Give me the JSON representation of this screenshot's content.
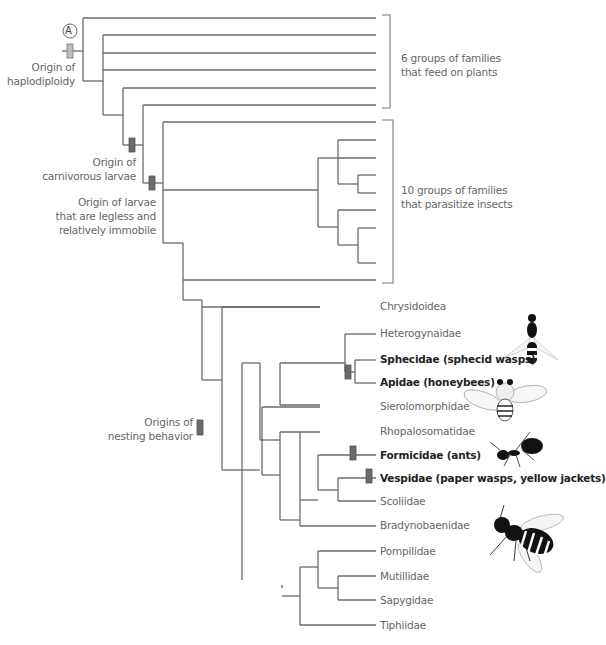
{
  "colors": {
    "line": "#6a6a6a",
    "marker_light": "#bdbdbd",
    "marker_dark": "#6b6b6b",
    "text": "#666666",
    "text_bold": "#222222"
  },
  "callout": {
    "letter": "A"
  },
  "annotations": {
    "haplodiploidy": [
      "Origin of",
      "haplodiploidy"
    ],
    "carnivorous": [
      "Origin of",
      "carnivorous larvae"
    ],
    "legless": [
      "Origin of larvae",
      "that are legless and",
      "relatively immobile"
    ],
    "nesting": [
      "Origins of",
      "nesting behavior"
    ]
  },
  "groups": {
    "plants": [
      "6 groups of families",
      "that feed on plants"
    ],
    "parasites": [
      "10 groups of families",
      "that parasitize insects"
    ]
  },
  "taxa": [
    {
      "name": "Chrysidoidea",
      "bold": false
    },
    {
      "name": "Heterogynaidae",
      "bold": false
    },
    {
      "name": "Sphecidae (sphecid wasps)",
      "bold": true
    },
    {
      "name": "Apidae (honeybees)",
      "bold": true
    },
    {
      "name": "Sierolomorphidae",
      "bold": false
    },
    {
      "name": "Rhopalosomatidae",
      "bold": false
    },
    {
      "name": "Formicidae (ants)",
      "bold": true
    },
    {
      "name": "Vespidae (paper wasps, yellow jackets)",
      "bold": true
    },
    {
      "name": "Scoliidae",
      "bold": false
    },
    {
      "name": "Bradynobaenidae",
      "bold": false
    },
    {
      "name": "Pompilidae",
      "bold": false
    },
    {
      "name": "Mutillidae",
      "bold": false
    },
    {
      "name": "Sapygidae",
      "bold": false
    },
    {
      "name": "Tiphiidae",
      "bold": false
    }
  ],
  "illustrations": [
    "sphecid-wasp",
    "honeybee",
    "ant",
    "yellow-jacket"
  ]
}
